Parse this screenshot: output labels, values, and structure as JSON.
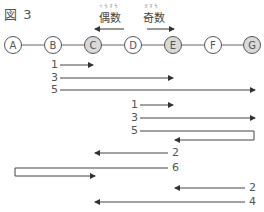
{
  "figure": {
    "title": "図 3",
    "even_label": {
      "text": "偶数",
      "ruby": "ぐうすう",
      "direction": "left"
    },
    "odd_label": {
      "text": "奇数",
      "ruby": "きすう",
      "direction": "right"
    },
    "nodes": [
      {
        "id": "A",
        "x": 13,
        "shaded": false
      },
      {
        "id": "B",
        "x": 53,
        "shaded": false
      },
      {
        "id": "C",
        "x": 93,
        "shaded": true
      },
      {
        "id": "D",
        "x": 133,
        "shaded": false
      },
      {
        "id": "E",
        "x": 173,
        "shaded": true
      },
      {
        "id": "F",
        "x": 213,
        "shaded": false
      },
      {
        "id": "G",
        "x": 252,
        "shaded": true
      }
    ],
    "colors": {
      "line": "#444444",
      "node_fill_shaded": "#d9d9d9",
      "node_fill": "#ffffff",
      "text": "#555555"
    },
    "moves_from_B": [
      {
        "label": "1",
        "y": 65,
        "from": 60,
        "to": 93,
        "dir": "right"
      },
      {
        "label": "3",
        "y": 78,
        "from": 60,
        "to": 173,
        "dir": "right"
      },
      {
        "label": "5",
        "y": 90,
        "from": 60,
        "to": 255,
        "dir": "right"
      }
    ],
    "moves_from_D": [
      {
        "label": "1",
        "y": 105,
        "from": 140,
        "to": 173,
        "dir": "right"
      },
      {
        "label": "3",
        "y": 118,
        "from": 140,
        "to": 255,
        "dir": "right"
      },
      {
        "label": "5",
        "y": 131,
        "from": 140,
        "to": 175,
        "dir": "bounce-left",
        "wall": 254,
        "y2": 140
      }
    ],
    "moves_left": [
      {
        "label": "2",
        "y": 153,
        "from": 168,
        "to": 95,
        "dir": "left"
      },
      {
        "label": "6",
        "y": 168,
        "from": 168,
        "to": 95,
        "dir": "bounce-right",
        "wall": 15,
        "y2": 176
      },
      {
        "label": "2",
        "y": 188,
        "from": 245,
        "to": 175,
        "dir": "left"
      },
      {
        "label": "4",
        "y": 202,
        "from": 245,
        "to": 95,
        "dir": "left"
      }
    ]
  }
}
